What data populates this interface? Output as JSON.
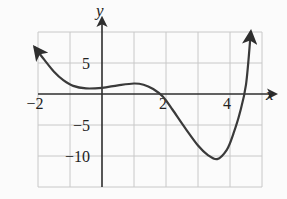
{
  "chart_data": {
    "type": "line",
    "title": "",
    "xlabel": "x",
    "ylabel": "y",
    "xlim": [
      -2,
      5
    ],
    "ylim": [
      -15,
      10
    ],
    "grid": true,
    "grid_x_step": 1,
    "grid_y_step": 5,
    "x_tick_labels": [
      {
        "value": -2,
        "label": "−2"
      },
      {
        "value": 2,
        "label": "2"
      },
      {
        "value": 4,
        "label": "4"
      }
    ],
    "y_tick_labels": [
      {
        "value": 5,
        "label": "5"
      },
      {
        "value": -5,
        "label": "−5"
      },
      {
        "value": -10,
        "label": "−10"
      }
    ],
    "series": [
      {
        "name": "f(x)",
        "color": "#3a3a3a",
        "arrows": "both-ends",
        "x": [
          -2.1,
          -1.8,
          -1.5,
          -1.2,
          -0.9,
          -0.5,
          0,
          0.5,
          1.0,
          1.3,
          1.6,
          1.9,
          2.2,
          2.6,
          3.0,
          3.3,
          3.6,
          3.9,
          4.1,
          4.3,
          4.5,
          4.65
        ],
        "y": [
          7.5,
          5.5,
          3.6,
          2.2,
          1.3,
          0.9,
          1.0,
          1.4,
          1.7,
          1.5,
          0.8,
          -0.4,
          -2.5,
          -5.5,
          -8.3,
          -9.8,
          -10.5,
          -9.0,
          -6.5,
          -3.2,
          1.5,
          10.0
        ]
      }
    ],
    "legend": null
  },
  "colors": {
    "axis": "#2e2e2e",
    "grid": "#c8c8c8",
    "curve": "#3a3a3a",
    "background": "#fbfbfb"
  }
}
